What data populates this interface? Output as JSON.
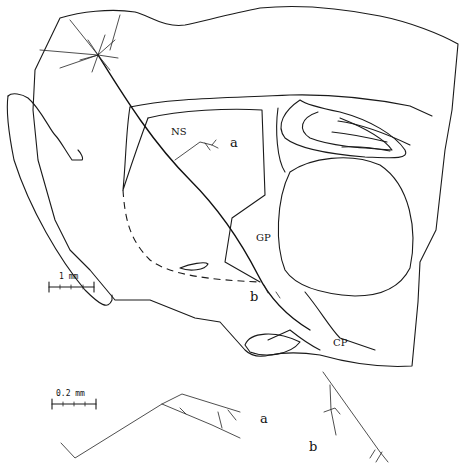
{
  "figure": {
    "type": "neuron tracing on brain section outline",
    "regions": {
      "ns": "NS",
      "gp": "GP",
      "cp": "CP"
    },
    "markers": {
      "a_top": "a",
      "b_top": "b",
      "a_inset": "a",
      "b_inset": "b"
    },
    "scale_bars": {
      "main": "1 mm",
      "inset": "0.2 mm"
    }
  }
}
